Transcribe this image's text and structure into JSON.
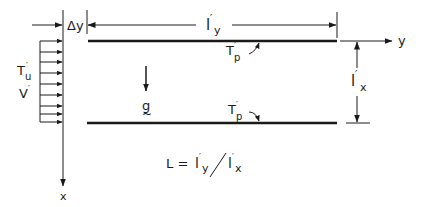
{
  "diagram": {
    "labels": {
      "delta_y": "Δy",
      "ly_main": "l",
      "ly_sub": "y",
      "lx_main": "l",
      "lx_sub": "x",
      "prime": "′",
      "tp_top_main": "T",
      "tp_top_sub": "p",
      "tp_bottom_main": "T",
      "tp_bottom_sub": "p",
      "tu_main": "T",
      "tu_sub": "u",
      "v": "V",
      "g": "g",
      "g_tilde": "~",
      "y_axis": "y",
      "x_axis": "x",
      "formula_lhs": "L =",
      "formula_num_main": "l",
      "formula_num_sub": "y",
      "formula_slash": "/",
      "formula_den_main": "l",
      "formula_den_sub": "x"
    },
    "colors": {
      "ink": "#1a1a1a",
      "background": "#ffffff"
    }
  }
}
